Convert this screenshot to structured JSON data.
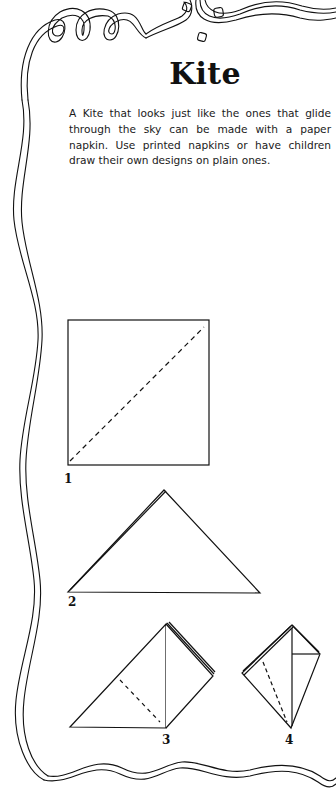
{
  "page": {
    "title": "Kite",
    "intro": "A Kite that looks just like the ones that glide through the sky can be made with a paper napkin. Use printed napkins or have children draw their own designs on plain ones."
  },
  "steps": [
    {
      "number": "1",
      "figure": "square napkin with dashed diagonal fold line"
    },
    {
      "number": "2",
      "figure": "napkin folded into triangle"
    },
    {
      "number": "3",
      "figure": "triangle with side folded up, dashed fold line"
    },
    {
      "number": "4",
      "figure": "finished kite shape"
    }
  ],
  "decoration": {
    "border": "ribbon-streamer-border",
    "confetti": "confetti-squares"
  },
  "colors": {
    "ink": "#111111",
    "paper": "#ffffff"
  }
}
